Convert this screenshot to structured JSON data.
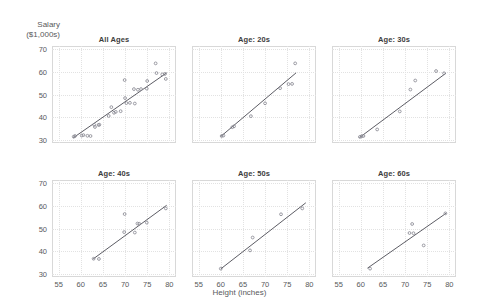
{
  "axes": {
    "ylabel_line1": "Salary",
    "ylabel_line2": "($1,000s)",
    "xlabel": "Height (inches)",
    "yticks": [
      30,
      40,
      50,
      60,
      70
    ],
    "xticks": [
      55,
      60,
      65,
      70,
      75,
      80
    ],
    "xlim": [
      53.5,
      81.5
    ],
    "ylim": [
      28.5,
      71.5
    ]
  },
  "style": {
    "marker_color": "#8a8a94",
    "line_color": "#4a4a52",
    "frame_color": "#d8d8d8",
    "grid_color": "#e2e2e2",
    "text_color": "#58595b"
  },
  "chart_data": {
    "type": "scatter",
    "title": "",
    "xlabel": "Height (inches)",
    "ylabel": "Salary ($1,000s)",
    "xlim": [
      53.5,
      81.5
    ],
    "ylim": [
      28.5,
      71.5
    ],
    "grid": true,
    "legend": "none",
    "layout": "2 rows x 3 columns of faceted scatter panels with fitted regression lines",
    "panels": [
      {
        "title": "All Ages",
        "row": 0,
        "col": 0,
        "points": [
          [
            58.4,
            31.3
          ],
          [
            58.7,
            31.6
          ],
          [
            60.2,
            31.8
          ],
          [
            60.6,
            32.0
          ],
          [
            61.5,
            31.7
          ],
          [
            62.2,
            31.6
          ],
          [
            63.0,
            36.6
          ],
          [
            63.2,
            35.6
          ],
          [
            64.0,
            36.5
          ],
          [
            64.2,
            36.6
          ],
          [
            66.3,
            40.5
          ],
          [
            66.9,
            44.4
          ],
          [
            67.5,
            41.9
          ],
          [
            67.9,
            42.3
          ],
          [
            69.0,
            42.6
          ],
          [
            69.9,
            56.4
          ],
          [
            70.0,
            48.4
          ],
          [
            70.3,
            46.2
          ],
          [
            71.1,
            46.3
          ],
          [
            72.2,
            46.0
          ],
          [
            72.0,
            52.4
          ],
          [
            72.9,
            52.1
          ],
          [
            73.6,
            52.4
          ],
          [
            74.9,
            52.6
          ],
          [
            75.0,
            56.0
          ],
          [
            76.9,
            63.8
          ],
          [
            77.1,
            59.5
          ],
          [
            78.4,
            58.9
          ],
          [
            79.0,
            59.1
          ],
          [
            79.2,
            56.9
          ]
        ],
        "fit_line": {
          "x0": 58.3,
          "y0": 30.8,
          "x1": 79.4,
          "y1": 59.6
        }
      },
      {
        "title": "Age: 20s",
        "row": 0,
        "col": 1,
        "points": [
          [
            60.2,
            31.6
          ],
          [
            60.6,
            31.8
          ],
          [
            62.6,
            35.5
          ],
          [
            63.0,
            35.9
          ],
          [
            66.8,
            40.4
          ],
          [
            70.0,
            46.1
          ],
          [
            73.4,
            52.8
          ],
          [
            75.3,
            54.6
          ],
          [
            76.1,
            54.7
          ],
          [
            76.8,
            63.8
          ]
        ],
        "fit_line": {
          "x0": 60.0,
          "y0": 31.4,
          "x1": 77.0,
          "y1": 59.6
        }
      },
      {
        "title": "Age: 30s",
        "row": 0,
        "col": 2,
        "points": [
          [
            59.8,
            31.2
          ],
          [
            60.2,
            31.5
          ],
          [
            60.6,
            31.6
          ],
          [
            63.7,
            34.5
          ],
          [
            68.8,
            42.5
          ],
          [
            71.2,
            52.2
          ],
          [
            72.3,
            56.2
          ],
          [
            77.0,
            60.4
          ],
          [
            78.8,
            59.4
          ]
        ],
        "fit_line": {
          "x0": 59.7,
          "y0": 30.9,
          "x1": 79.2,
          "y1": 59.4
        }
      },
      {
        "title": "Age: 40s",
        "row": 1,
        "col": 0,
        "points": [
          [
            62.9,
            36.6
          ],
          [
            64.1,
            36.5
          ],
          [
            69.8,
            48.4
          ],
          [
            69.9,
            56.4
          ],
          [
            72.2,
            48.2
          ],
          [
            72.8,
            52.2
          ],
          [
            73.2,
            52.1
          ],
          [
            74.9,
            52.6
          ],
          [
            79.2,
            58.9
          ]
        ],
        "fit_line": {
          "x0": 62.8,
          "y0": 36.5,
          "x1": 79.4,
          "y1": 60.3
        }
      },
      {
        "title": "Age: 50s",
        "row": 1,
        "col": 1,
        "points": [
          [
            60.0,
            32.2
          ],
          [
            66.6,
            40.3
          ],
          [
            67.2,
            46.0
          ],
          [
            73.6,
            56.3
          ],
          [
            78.4,
            58.9
          ]
        ],
        "fit_line": {
          "x0": 60.0,
          "y0": 32.1,
          "x1": 79.2,
          "y1": 61.4
        }
      },
      {
        "title": "Age: 60s",
        "row": 1,
        "col": 2,
        "points": [
          [
            62.1,
            32.2
          ],
          [
            71.0,
            48.0
          ],
          [
            71.6,
            52.0
          ],
          [
            71.9,
            47.9
          ],
          [
            74.2,
            42.5
          ],
          [
            79.1,
            56.7
          ]
        ],
        "fit_line": {
          "x0": 61.5,
          "y0": 32.4,
          "x1": 79.3,
          "y1": 56.8
        }
      }
    ]
  }
}
